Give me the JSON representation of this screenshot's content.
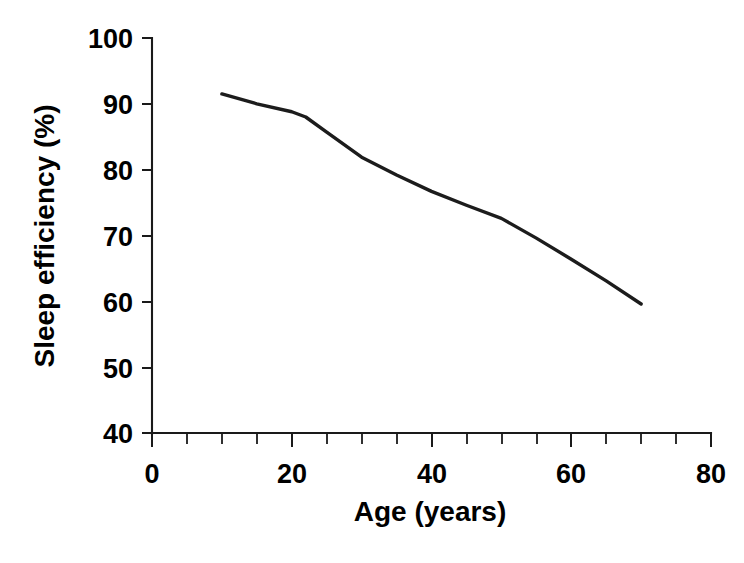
{
  "chart_data": {
    "type": "line",
    "title": "",
    "xlabel": "Age (years)",
    "ylabel": "Sleep efficiency (%)",
    "xlim": [
      0,
      80
    ],
    "ylim": [
      40,
      100
    ],
    "grid": false,
    "legend": null,
    "x_major_ticks": [
      0,
      20,
      40,
      60,
      80
    ],
    "x_major_tick_labels": [
      "0",
      "20",
      "40",
      "60",
      "80"
    ],
    "x_minor_tick_step": 5,
    "y_major_ticks": [
      40,
      50,
      60,
      70,
      80,
      90,
      100
    ],
    "y_major_tick_labels": [
      "40",
      "50",
      "60",
      "70",
      "80",
      "90",
      "100"
    ],
    "series": [
      {
        "name": "Sleep efficiency",
        "color": "#1c1c1c",
        "x": [
          10,
          15,
          20,
          22,
          25,
          30,
          35,
          40,
          45,
          50,
          55,
          60,
          65,
          70
        ],
        "values": [
          91.5,
          90.0,
          88.8,
          88.0,
          85.7,
          81.9,
          79.2,
          76.7,
          74.6,
          72.6,
          69.6,
          66.4,
          63.1,
          59.6
        ]
      }
    ]
  },
  "axis": {
    "x_label": "Age (years)",
    "y_label": "Sleep efficiency (%)",
    "x_ticks": [
      "0",
      "20",
      "40",
      "60",
      "80"
    ],
    "y_ticks": [
      "100",
      "90",
      "80",
      "70",
      "60",
      "50",
      "40"
    ]
  },
  "colors": {
    "line": "#1c1c1c",
    "axis": "#1a1a1a",
    "background": "#ffffff",
    "text": "#000000"
  }
}
